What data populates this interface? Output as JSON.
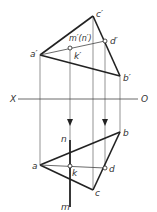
{
  "diagram": {
    "type": "orthographic-projection",
    "axis": {
      "left_label": "X",
      "right_label": "O"
    },
    "front_view": {
      "labels": {
        "a": "a′",
        "b": "b′",
        "c": "c′",
        "d": "d′",
        "k": "k′",
        "mn": "m′(n′)"
      }
    },
    "top_view": {
      "labels": {
        "a": "a",
        "b": "b",
        "c": "c",
        "d": "d",
        "k": "k",
        "n": "n",
        "m": "m"
      }
    },
    "colors": {
      "line": "#222222",
      "thin": "#555555",
      "background": "#ffffff"
    }
  }
}
